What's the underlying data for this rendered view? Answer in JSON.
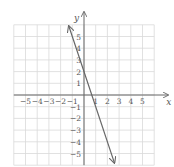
{
  "chart_data": {
    "type": "line",
    "title": "",
    "xlabel": "x",
    "ylabel": "y",
    "xlim": [
      -6,
      6
    ],
    "ylim": [
      -6,
      6
    ],
    "grid": true,
    "x_ticks": [
      "-5",
      "-4",
      "-3",
      "-2",
      "-1",
      "1",
      "2",
      "3",
      "4",
      "5"
    ],
    "y_ticks": [
      "5",
      "4",
      "3",
      "2",
      "1",
      "-1",
      "-2",
      "-3",
      "-4",
      "-5"
    ],
    "series": [
      {
        "name": "y = -3x + 2",
        "equation": "y = -3x + 2",
        "slope": -3,
        "intercept": 2,
        "x": [
          -1.3,
          0,
          0.667,
          2.6
        ],
        "y": [
          5.9,
          2,
          0,
          -5.8
        ],
        "arrows": "both"
      }
    ]
  },
  "axes": {
    "x_label": "x",
    "y_label": "y"
  }
}
